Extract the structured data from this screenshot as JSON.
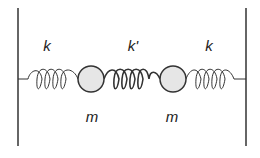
{
  "diagram": {
    "labels": {
      "spring_left": "k",
      "spring_middle": "k'",
      "spring_right": "k",
      "mass_left": "m",
      "mass_right": "m"
    },
    "colors": {
      "line": "#333333",
      "mass_fill": "#e6e6e6"
    }
  }
}
